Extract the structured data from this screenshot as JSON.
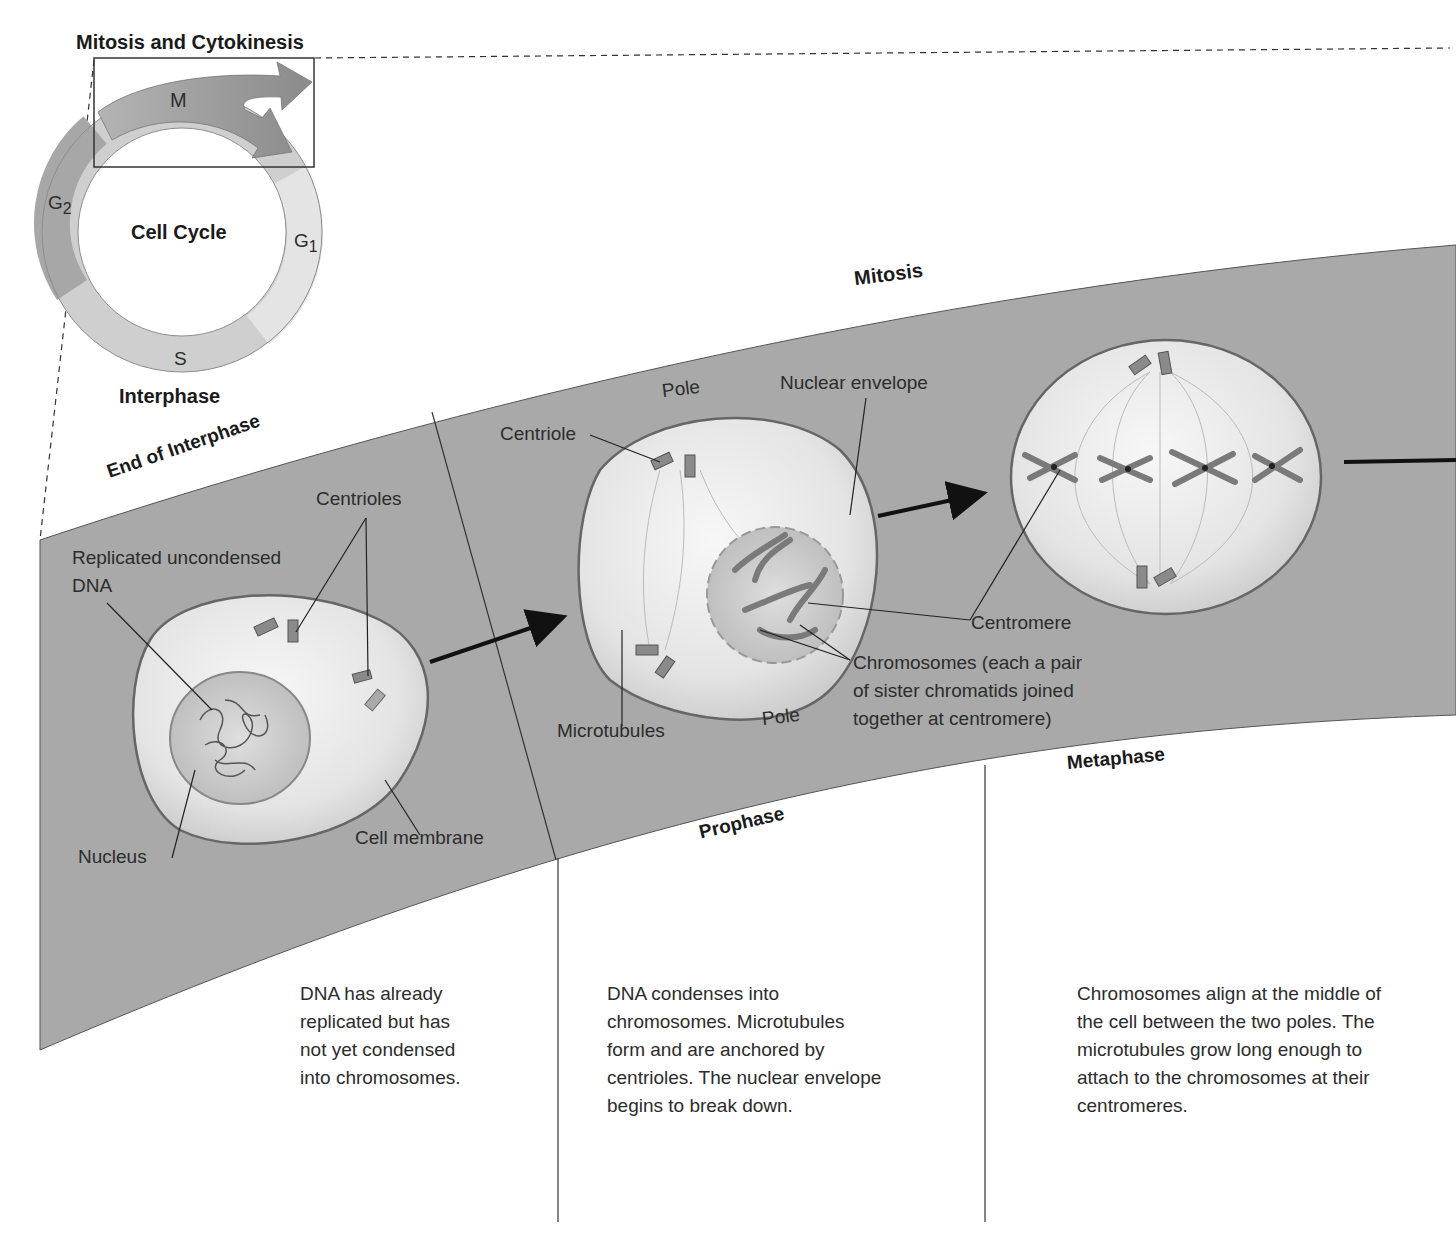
{
  "header": {
    "title": "Mitosis and Cytokinesis"
  },
  "cell_cycle": {
    "center_label": "Cell Cycle",
    "interphase_label": "Interphase",
    "phases": [
      {
        "id": "M",
        "label": "M",
        "color": "#9a9a9a"
      },
      {
        "id": "G1",
        "label": "G",
        "subscript": "1",
        "color": "#e2e2e2"
      },
      {
        "id": "S",
        "label": "S",
        "color": "#cfcfcf"
      },
      {
        "id": "G2",
        "label": "G",
        "subscript": "2",
        "color": "#a8a8a8"
      }
    ]
  },
  "band": {
    "title": "Mitosis",
    "color": "#a9a9a9"
  },
  "stages": [
    {
      "id": "end-of-interphase",
      "title": "End of Interphase",
      "labels": {
        "dna": "Replicated uncondensed\nDNA",
        "centrioles": "Centrioles",
        "nucleus": "Nucleus",
        "cell_membrane": "Cell membrane"
      },
      "description": "DNA has already\nreplicated but has\nnot yet condensed\ninto chromosomes."
    },
    {
      "id": "prophase",
      "title": "Prophase",
      "labels": {
        "pole_top": "Pole",
        "centriole": "Centriole",
        "nuclear_envelope": "Nuclear envelope",
        "microtubules": "Microtubules",
        "pole_bottom": "Pole",
        "chromosomes": "Chromosomes (each a pair\nof sister chromatids joined\ntogether at centromere)",
        "centromere": "Centromere"
      },
      "description": "DNA condenses into\nchromosomes. Microtubules\nform and are anchored by\ncentrioles. The nuclear envelope\nbegins to break down."
    },
    {
      "id": "metaphase",
      "title": "Metaphase",
      "description": "Chromosomes align at the middle of\nthe cell between the two poles. The\nmicrotubules grow long enough to\nattach to the chromosomes at their\ncentromeres."
    }
  ]
}
